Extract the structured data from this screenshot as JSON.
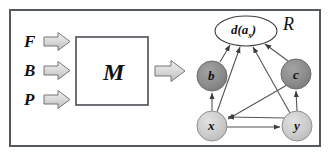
{
  "diagram": {
    "frame": {
      "border_color": "#555a5e"
    },
    "inputs": [
      {
        "label": "F",
        "name": "input-f"
      },
      {
        "label": "B",
        "name": "input-b"
      },
      {
        "label": "P",
        "name": "input-p"
      }
    ],
    "model_box": {
      "label": "M",
      "border_color": "#4a4f54"
    },
    "region_label": "R",
    "arrow_fill": "#d9d9d9",
    "arrow_stroke": "#6e6e6e",
    "graph": {
      "nodes": [
        {
          "id": "d",
          "label": "d(a",
          "sub": "s",
          "suffix": ")",
          "shape": "ellipse",
          "fill": "#ffffff",
          "cx": 246,
          "cy": 31,
          "rx": 31,
          "ry": 15
        },
        {
          "id": "b",
          "label": "b",
          "shape": "circle",
          "fill": "#8c8c8c",
          "cx": 212,
          "cy": 76,
          "r": 15
        },
        {
          "id": "c",
          "label": "c",
          "shape": "circle",
          "fill": "#8c8c8c",
          "cx": 296,
          "cy": 74,
          "r": 15
        },
        {
          "id": "x",
          "label": "x",
          "shape": "circle",
          "fill": "#c9c9c9",
          "cx": 212,
          "cy": 126,
          "r": 15
        },
        {
          "id": "y",
          "label": "y",
          "shape": "circle",
          "fill": "#c9c9c9",
          "cx": 297,
          "cy": 126,
          "r": 15
        }
      ],
      "edges": [
        {
          "from": "b",
          "to": "d"
        },
        {
          "from": "c",
          "to": "d"
        },
        {
          "from": "x",
          "to": "d"
        },
        {
          "from": "y",
          "to": "d"
        },
        {
          "from": "x",
          "to": "b"
        },
        {
          "from": "y",
          "to": "c"
        },
        {
          "from": "x",
          "to": "y"
        },
        {
          "from": "c",
          "to": "x"
        },
        {
          "from": "y",
          "to": "x"
        }
      ],
      "edge_color": "#555555"
    }
  }
}
